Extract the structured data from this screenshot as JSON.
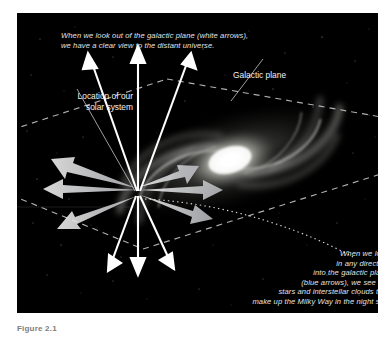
{
  "figure": {
    "domain": "diagram",
    "background_color": "#ffffff",
    "panel_color": "#000000",
    "text_color": "#e9e9e9",
    "accent_white": "#ffffff",
    "caption_below": "Figure 2.1"
  },
  "captions": {
    "top": "When we look out of the galactic plane (white arrows),\nwe have a clear view to the distant universe.",
    "bottom": "When we look\nin any direction\ninto the galactic plane\n(blue arrows), we see the\nstars and interstellar clouds that\nmake up the Milky Way in the night sky."
  },
  "labels": {
    "solar_system": "Location of our\nsolar system",
    "galactic_plane": "Galactic plane"
  },
  "legend": {
    "white_arrows_meaning": "looking out of the galactic plane",
    "blue_arrows_meaning": "looking into the galactic plane"
  },
  "geometry": {
    "hub_x": 121,
    "hub_y": 180,
    "galaxy_core_x": 213,
    "galaxy_core_y": 147,
    "white_arrows_up": 3,
    "white_arrows_down": 3,
    "blue_arrows_in_plane": 6
  }
}
